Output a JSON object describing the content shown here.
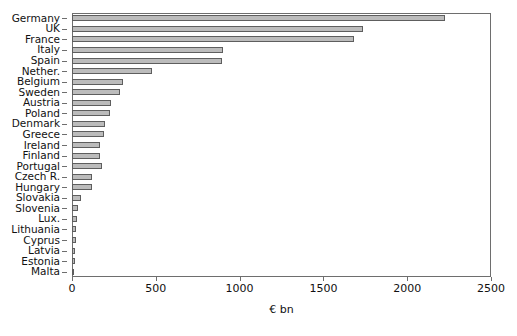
{
  "chart_data": {
    "type": "bar",
    "orientation": "horizontal",
    "title": "",
    "xlabel": "€ bn",
    "ylabel": "",
    "xlim": [
      0,
      2500
    ],
    "xticks": [
      0,
      500,
      1000,
      1500,
      2000,
      2500
    ],
    "xtick_labels": [
      "0",
      "500",
      "1000",
      "1500",
      "2000",
      "2500"
    ],
    "grid": false,
    "legend": null,
    "bar_fill_color": "#bcbcbc",
    "bar_edge_color": "#5e5e5e",
    "axis_color": "#6e6e6e",
    "categories": [
      "Germany",
      "UK",
      "France",
      "Italy",
      "Spain",
      "Nether.",
      "Belgium",
      "Sweden",
      "Austria",
      "Poland",
      "Denmark",
      "Greece",
      "Ireland",
      "Finland",
      "Portugal",
      "Czech R.",
      "Hungary",
      "Slovakia",
      "Slovenia",
      "Lux.",
      "Lithuania",
      "Cyprus",
      "Latvia",
      "Estonia",
      "Malta"
    ],
    "values": [
      2225,
      1735,
      1680,
      900,
      895,
      480,
      305,
      288,
      235,
      228,
      198,
      192,
      168,
      166,
      180,
      120,
      118,
      55,
      38,
      32,
      26,
      22,
      20,
      16,
      6
    ]
  }
}
